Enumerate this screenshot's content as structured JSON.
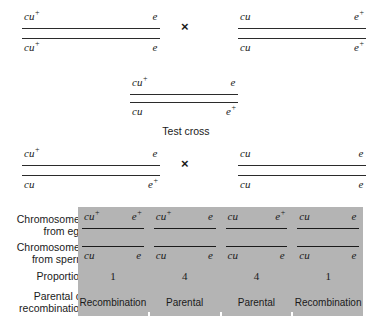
{
  "figure": {
    "cross_symbol": "×",
    "test_cross_caption": "Test cross",
    "panel_color": "#b4b4b4"
  },
  "parental_cross": {
    "female_parent": {
      "top": {
        "left": "cu",
        "left_sup": "+",
        "right": "e",
        "right_sup": ""
      },
      "bottom": {
        "left": "cu",
        "left_sup": "+",
        "right": "e",
        "right_sup": ""
      }
    },
    "male_parent": {
      "top": {
        "left": "cu",
        "left_sup": "",
        "right": "e",
        "right_sup": "+"
      },
      "bottom": {
        "left": "cu",
        "left_sup": "",
        "right": "e",
        "right_sup": "+"
      }
    }
  },
  "f1": {
    "top": {
      "left": "cu",
      "left_sup": "+",
      "right": "e",
      "right_sup": ""
    },
    "bottom": {
      "left": "cu",
      "left_sup": "",
      "right": "e",
      "right_sup": "+"
    }
  },
  "test_cross": {
    "f1_heterozygote": {
      "top": {
        "left": "cu",
        "left_sup": "+",
        "right": "e",
        "right_sup": ""
      },
      "bottom": {
        "left": "cu",
        "left_sup": "",
        "right": "e",
        "right_sup": "+"
      }
    },
    "tester": {
      "top": {
        "left": "cu",
        "left_sup": "",
        "right": "e",
        "right_sup": ""
      },
      "bottom": {
        "left": "cu",
        "left_sup": "",
        "right": "e",
        "right_sup": ""
      }
    }
  },
  "results_table": {
    "row_labels": [
      "Chromosomes from egg",
      "Chromosomes from sperm",
      "Proportion",
      "Parental or recombination"
    ],
    "row_labels_lines": {
      "egg": [
        "Chromosomes",
        "from egg"
      ],
      "sperm": [
        "Chromosomes",
        "from sperm"
      ],
      "prop": [
        "Proportion"
      ],
      "class": [
        "Parental or",
        "recombination"
      ]
    },
    "columns": [
      {
        "egg": {
          "left": "cu",
          "left_sup": "+",
          "right": "e",
          "right_sup": "+"
        },
        "sperm": {
          "left": "cu",
          "left_sup": "",
          "right": "e",
          "right_sup": ""
        },
        "proportion": "1",
        "classification": "Recombination"
      },
      {
        "egg": {
          "left": "cu",
          "left_sup": "+",
          "right": "e",
          "right_sup": ""
        },
        "sperm": {
          "left": "cu",
          "left_sup": "",
          "right": "e",
          "right_sup": ""
        },
        "proportion": "4",
        "classification": "Parental"
      },
      {
        "egg": {
          "left": "cu",
          "left_sup": "",
          "right": "e",
          "right_sup": "+"
        },
        "sperm": {
          "left": "cu",
          "left_sup": "",
          "right": "e",
          "right_sup": ""
        },
        "proportion": "4",
        "classification": "Parental"
      },
      {
        "egg": {
          "left": "cu",
          "left_sup": "",
          "right": "e",
          "right_sup": ""
        },
        "sperm": {
          "left": "cu",
          "left_sup": "",
          "right": "e",
          "right_sup": ""
        },
        "proportion": "1",
        "classification": "Recombination"
      }
    ]
  }
}
